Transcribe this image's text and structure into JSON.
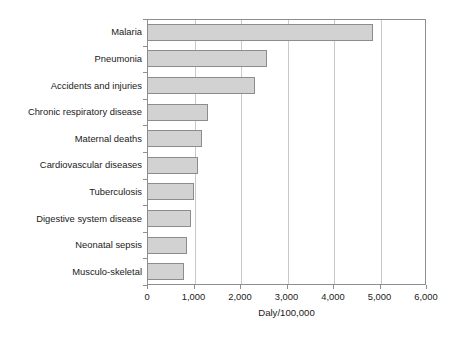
{
  "chart_data": {
    "type": "bar",
    "orientation": "horizontal",
    "title": "",
    "subtitle": "",
    "xlabel": "Daly/100,000",
    "ylabel": "",
    "xlim": [
      0,
      6000
    ],
    "xticks": [
      0,
      1000,
      2000,
      3000,
      4000,
      5000,
      6000
    ],
    "xtick_labels": [
      "0",
      "1,000",
      "2,000",
      "3,000",
      "4,000",
      "5,000",
      "6,000"
    ],
    "grid": "vertical",
    "legend": null,
    "legend_position": "none",
    "bar_fill_color": "#d2d2d2",
    "bar_border_color": "#8c8c8c",
    "axis_color": "#8e8e8e",
    "gridline_color": "#c9c9c9",
    "categories": [
      "Malaria",
      "Pneumonia",
      "Accidents and injuries",
      "Chronic respiratory disease",
      "Maternal deaths",
      "Cardiovascular diseases",
      "Tuberculosis",
      "Digestive system disease",
      "Neonatal sepsis",
      "Musculo-skeletal"
    ],
    "values": [
      4860,
      2570,
      2330,
      1320,
      1190,
      1100,
      1000,
      940,
      870,
      800
    ]
  }
}
